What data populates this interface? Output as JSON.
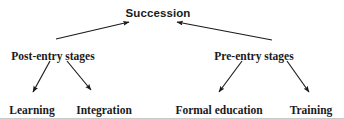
{
  "figure": {
    "title": "Succession",
    "stroke_color": "#1a1a1a",
    "text_color": "#1a1a1a",
    "background_color": "#ffffff",
    "border_color": "#c9c9c9"
  },
  "nodes": {
    "root": {
      "label": "Succession",
      "x": 158,
      "y": 8
    },
    "branches": [
      {
        "id": "post-entry-stages",
        "label": "Post-entry stages",
        "x": 53,
        "y": 51
      },
      {
        "id": "pre-entry-stages",
        "label": "Pre-entry stages",
        "x": 254,
        "y": 51
      }
    ],
    "leaves": [
      {
        "id": "learning",
        "label": "Learning",
        "x": 32,
        "y": 105
      },
      {
        "id": "integration",
        "label": "Integration",
        "x": 104,
        "y": 105
      },
      {
        "id": "formal-education",
        "label": "Formal education",
        "x": 219,
        "y": 105
      },
      {
        "id": "training",
        "label": "Training",
        "x": 311,
        "y": 105
      }
    ]
  },
  "edges": [
    {
      "id": "post-entry-to-succession",
      "from": "post-entry-stages",
      "to": "root",
      "x1": 56,
      "y1": 39,
      "x2": 129,
      "y2": 22
    },
    {
      "id": "pre-entry-to-succession",
      "from": "pre-entry-stages",
      "to": "root",
      "x1": 272,
      "y1": 40,
      "x2": 177,
      "y2": 22
    },
    {
      "id": "post-entry-to-learning",
      "from": "post-entry-stages",
      "to": "learning",
      "x1": 50,
      "y1": 61,
      "x2": 33,
      "y2": 92
    },
    {
      "id": "post-entry-to-integration",
      "from": "post-entry-stages",
      "to": "integration",
      "x1": 67,
      "y1": 61,
      "x2": 91,
      "y2": 90
    },
    {
      "id": "pre-entry-to-formal-education",
      "from": "pre-entry-stages",
      "to": "formal-education",
      "x1": 242,
      "y1": 61,
      "x2": 219,
      "y2": 92
    },
    {
      "id": "pre-entry-to-training",
      "from": "pre-entry-stages",
      "to": "training",
      "x1": 287,
      "y1": 61,
      "x2": 309,
      "y2": 92
    }
  ]
}
